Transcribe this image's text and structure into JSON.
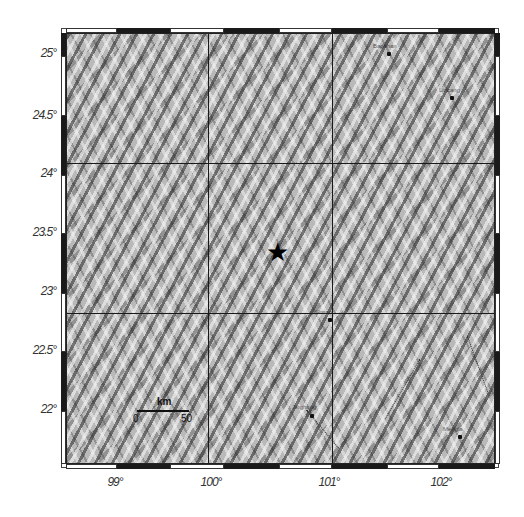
{
  "map": {
    "type": "shaded-relief topographic map",
    "bounds": {
      "lon_min": 98.5,
      "lon_max": 102.6,
      "lat_min": 21.5,
      "lat_max": 25.2
    },
    "latitude_labels": [
      "25°",
      "24.5°",
      "24°",
      "23.5°",
      "23°",
      "22.5°",
      "22°"
    ],
    "longitude_labels": [
      "99°",
      "100°",
      "101°",
      "102°"
    ],
    "epicenter": {
      "symbol": "star-icon",
      "glyph": "★",
      "lon": 100.5,
      "lat": 23.35
    },
    "scale_bar": {
      "unit": "km",
      "start": "0",
      "end": "50"
    },
    "city_labels": [
      {
        "name": "Baoshan",
        "lon": 101.6,
        "lat": 25.0
      },
      {
        "name": "Lincang",
        "lon": 102.1,
        "lat": 24.55
      },
      {
        "name": "Simao",
        "lon": 101.0,
        "lat": 22.75
      },
      {
        "name": "Jinghong",
        "lon": 100.8,
        "lat": 21.95
      },
      {
        "name": "Mengla",
        "lon": 102.1,
        "lat": 21.8
      }
    ],
    "colors": {
      "relief_dark": "#3a3a3a",
      "relief_light": "#eeeeee",
      "frame": "#1a1a1a",
      "grid": "#1a1a1a"
    }
  }
}
